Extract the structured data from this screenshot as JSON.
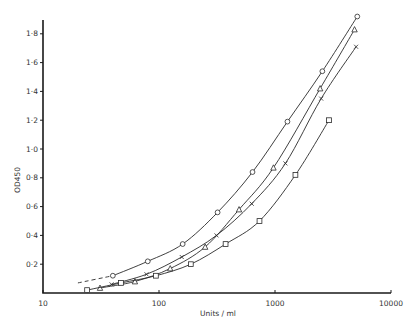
{
  "chart_data": {
    "type": "line",
    "title": "",
    "xlabel": "Units / ml",
    "ylabel": "OD450",
    "xscale": "log",
    "xlim": [
      10,
      10000
    ],
    "ylim": [
      0,
      1.9
    ],
    "grid": false,
    "legend": null,
    "x_ticks": [
      {
        "value": 10,
        "label": "10"
      },
      {
        "value": 100,
        "label": "100"
      },
      {
        "value": 1000,
        "label": "1000"
      },
      {
        "value": 10000,
        "label": "10000"
      }
    ],
    "y_ticks": [
      {
        "value": 0.2,
        "label": "0·2"
      },
      {
        "value": 0.4,
        "label": "0·4"
      },
      {
        "value": 0.6,
        "label": "0·6"
      },
      {
        "value": 0.8,
        "label": "0·8"
      },
      {
        "value": 1.0,
        "label": "1·0"
      },
      {
        "value": 1.2,
        "label": "1·2"
      },
      {
        "value": 1.4,
        "label": "1·4"
      },
      {
        "value": 1.6,
        "label": "1·6"
      },
      {
        "value": 1.8,
        "label": "1·8"
      }
    ],
    "series": [
      {
        "name": "circle",
        "marker": "circle",
        "x": [
          40,
          80,
          160,
          320,
          640,
          1280,
          2560,
          5120
        ],
        "values": [
          0.12,
          0.22,
          0.34,
          0.56,
          0.84,
          1.19,
          1.54,
          1.92
        ],
        "dashed_extension": {
          "x": [
            20,
            40
          ],
          "values": [
            0.07,
            0.12
          ]
        }
      },
      {
        "name": "triangle",
        "marker": "triangle",
        "x": [
          31,
          62,
          125,
          250,
          490,
          970,
          2450,
          4850
        ],
        "values": [
          0.035,
          0.08,
          0.17,
          0.32,
          0.58,
          0.87,
          1.42,
          1.83
        ]
      },
      {
        "name": "cross",
        "marker": "cross",
        "x": [
          39,
          78,
          157,
          313,
          630,
          1230,
          2500,
          5000
        ],
        "values": [
          0.06,
          0.13,
          0.25,
          0.4,
          0.62,
          0.9,
          1.35,
          1.71
        ]
      },
      {
        "name": "square",
        "marker": "square",
        "x": [
          24,
          47,
          94,
          188,
          375,
          735,
          1500,
          2920
        ],
        "values": [
          0.02,
          0.07,
          0.12,
          0.2,
          0.34,
          0.5,
          0.82,
          1.2
        ]
      }
    ]
  },
  "layout": {
    "plot_left": 43,
    "plot_right": 391,
    "plot_top": 20,
    "plot_bottom": 293,
    "px_per_decade": 116,
    "px_per_unit_y": 144
  }
}
